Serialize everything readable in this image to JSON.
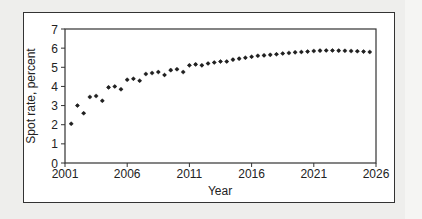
{
  "chart_data": {
    "type": "scatter",
    "title": "",
    "xlabel": "Year",
    "ylabel": "Spot rate, percent",
    "xlim": [
      2001,
      2026
    ],
    "ylim": [
      0,
      7
    ],
    "x_ticks": [
      "2001",
      "2006",
      "2011",
      "2016",
      "2021",
      "2026"
    ],
    "y_ticks": [
      "0",
      "1",
      "2",
      "3",
      "4",
      "5",
      "6",
      "7"
    ],
    "grid": false,
    "legend": null,
    "marker_color": "#222222",
    "series": [
      {
        "name": "Spot rate",
        "x": [
          2001.5,
          2002.0,
          2002.5,
          2003.0,
          2003.5,
          2004.0,
          2004.5,
          2005.0,
          2005.5,
          2006.0,
          2006.5,
          2007.0,
          2007.5,
          2008.0,
          2008.5,
          2009.0,
          2009.5,
          2010.0,
          2010.5,
          2011.0,
          2011.5,
          2012.0,
          2012.5,
          2013.0,
          2013.5,
          2014.0,
          2014.5,
          2015.0,
          2015.5,
          2016.0,
          2016.5,
          2017.0,
          2017.5,
          2018.0,
          2018.5,
          2019.0,
          2019.5,
          2020.0,
          2020.5,
          2021.0,
          2021.5,
          2022.0,
          2022.5,
          2023.0,
          2023.5,
          2024.0,
          2024.5,
          2025.0,
          2025.5
        ],
        "values": [
          2.05,
          3.0,
          2.6,
          3.45,
          3.5,
          3.25,
          3.95,
          4.0,
          3.85,
          4.35,
          4.4,
          4.3,
          4.65,
          4.7,
          4.75,
          4.6,
          4.85,
          4.9,
          4.75,
          5.1,
          5.15,
          5.1,
          5.2,
          5.25,
          5.3,
          5.3,
          5.4,
          5.45,
          5.5,
          5.55,
          5.6,
          5.62,
          5.65,
          5.68,
          5.72,
          5.75,
          5.78,
          5.8,
          5.82,
          5.85,
          5.87,
          5.88,
          5.88,
          5.87,
          5.86,
          5.85,
          5.84,
          5.82,
          5.8
        ]
      }
    ]
  }
}
